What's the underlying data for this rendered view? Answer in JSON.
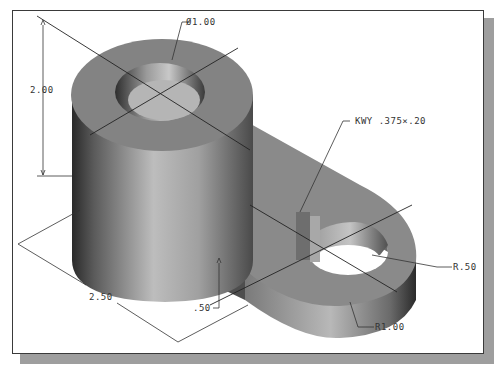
{
  "figure": {
    "type": "isometric-part-drawing",
    "frame_color": "#3a3a3a",
    "shadow_color": "#9e9e9e",
    "part_color": "#8c8c8c"
  },
  "dimensions": {
    "hole_diameter": "Ø1.00",
    "boss_height": "2.00",
    "keyway": "KWY .375×.20",
    "arm_length": "2.50",
    "arm_thickness": ".50",
    "eye_hole_radius": "R.50",
    "eye_outer_radius": "R1.00"
  }
}
